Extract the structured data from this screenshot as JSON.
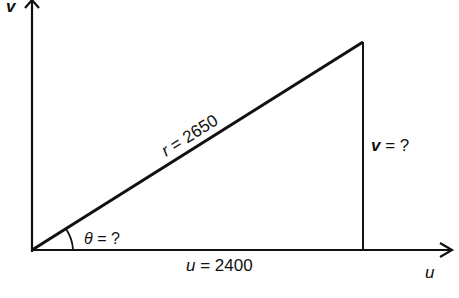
{
  "diagram": {
    "axes": {
      "vertical_label": "v",
      "horizontal_label": "u"
    },
    "labels": {
      "hypotenuse_var": "r",
      "hypotenuse_eq": " = 2650",
      "vertical_side_var": "v",
      "vertical_side_eq": " = ?",
      "angle_var": "θ",
      "angle_eq": " = ?",
      "horizontal_side_var": "u",
      "horizontal_side_eq": " = 2400"
    },
    "values": {
      "r": 2650,
      "u": 2400,
      "v": "?",
      "theta": "?"
    },
    "colors": {
      "stroke": "#111111",
      "background": "#ffffff"
    }
  }
}
